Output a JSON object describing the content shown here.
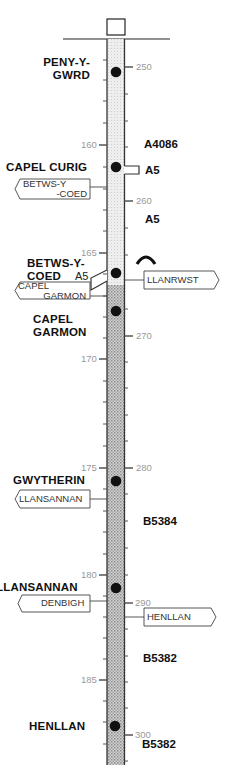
{
  "map": {
    "title": "Route strip: Peny-y-Gwrd to Henllan",
    "strip_color_light": "#e2e2e2",
    "strip_color_dark": "#bdbdbd",
    "places": [
      {
        "id": "peny-y-gwrd",
        "line1": "PENY-Y-",
        "line2": "GWRD"
      },
      {
        "id": "capel-curig",
        "line1": "CAPEL CURIG",
        "line2": ""
      },
      {
        "id": "betws-y-coed",
        "line1": "BETWS-Y-",
        "line2": "COED"
      },
      {
        "id": "capel-garmon",
        "line1": "CAPEL",
        "line2": "GARMON"
      },
      {
        "id": "gwytherin",
        "line1": "GWYTHERIN",
        "line2": ""
      },
      {
        "id": "llansannan",
        "line1": "LLANSANNAN",
        "line2": ""
      },
      {
        "id": "henllan",
        "line1": "HENLLAN",
        "line2": ""
      }
    ],
    "roads": [
      "A4086",
      "A5",
      "A5",
      "B5384",
      "B5382",
      "B5382"
    ],
    "junction_road_label": "A5",
    "signs": [
      {
        "line1": "BETWS-Y",
        "line2": "-COED",
        "side": "left"
      },
      {
        "line1": "CAPEL",
        "line2": "GARMON",
        "side": "left"
      },
      {
        "line1": "LLANRWST",
        "line2": "",
        "side": "right"
      },
      {
        "line1": "LLANSANNAN",
        "line2": "",
        "side": "left"
      },
      {
        "line1": "DENBIGH",
        "line2": "",
        "side": "left"
      },
      {
        "line1": "HENLLAN",
        "line2": "",
        "side": "right"
      }
    ],
    "left_scale": [
      "160",
      "165",
      "170",
      "175",
      "180",
      "185"
    ],
    "right_scale": [
      "250",
      "260",
      "270",
      "280",
      "290",
      "300"
    ],
    "hill_symbol": "steep-hill-icon"
  }
}
